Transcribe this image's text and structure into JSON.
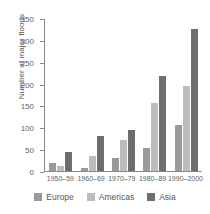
{
  "chart_data": {
    "type": "bar",
    "title": "",
    "xlabel": "",
    "ylabel": "Number of major floods",
    "categories": [
      "1950–59",
      "1960–69",
      "1970–79",
      "1980–89",
      "1990–2000"
    ],
    "series": [
      {
        "name": "Europe",
        "color": "#9a9a9a",
        "values": [
          19,
          7,
          29,
          53,
          105
        ]
      },
      {
        "name": "Americas",
        "color": "#bdbdbd",
        "values": [
          11,
          34,
          70,
          155,
          194
        ]
      },
      {
        "name": "Asia",
        "color": "#6e6e6e",
        "values": [
          44,
          81,
          93,
          217,
          324
        ]
      }
    ],
    "ylim": [
      0,
      350
    ],
    "yticks": [
      0,
      50,
      100,
      150,
      200,
      250,
      300,
      350
    ],
    "ytick_labels": [
      "0",
      "50",
      "100",
      "150",
      "200",
      "250",
      "300",
      "350"
    ],
    "grid": false,
    "legend_position": "bottom"
  },
  "axis": {
    "y_title": "Number of major floods"
  }
}
